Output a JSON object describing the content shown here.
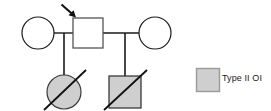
{
  "diagram": {
    "type": "pedigree-chart",
    "title": "",
    "generations": [
      {
        "id": "I",
        "members": [
          {
            "id": "I-1",
            "symbol": "circle",
            "sex": "female",
            "affected": false,
            "deceased": false,
            "proband": false,
            "fill": "#ffffff",
            "stroke": "#1a1a1a",
            "cx": 38,
            "cy": 33,
            "r": 16
          },
          {
            "id": "I-2",
            "symbol": "square",
            "sex": "male",
            "affected": false,
            "deceased": false,
            "proband": true,
            "fill": "#ffffff",
            "stroke": "#444444",
            "x": 73,
            "y": 18,
            "size": 30
          },
          {
            "id": "I-3",
            "symbol": "circle",
            "sex": "female",
            "affected": false,
            "deceased": false,
            "proband": false,
            "fill": "#ffffff",
            "stroke": "#1a1a1a",
            "cx": 155,
            "cy": 33,
            "r": 16
          }
        ]
      },
      {
        "id": "II",
        "members": [
          {
            "id": "II-1",
            "symbol": "circle",
            "sex": "female",
            "affected": true,
            "deceased": true,
            "proband": false,
            "fill": "#cfcfcf",
            "stroke": "#3a3a3a",
            "cx": 64,
            "cy": 92,
            "r": 17
          },
          {
            "id": "II-2",
            "symbol": "square",
            "sex": "male",
            "affected": true,
            "deceased": true,
            "proband": false,
            "fill": "#cfcfcf",
            "stroke": "#3a3a3a",
            "x": 109,
            "y": 76,
            "size": 32
          }
        ]
      }
    ],
    "mating_lines": [
      {
        "id": "union-1",
        "x1": 54,
        "y1": 33,
        "x2": 73,
        "y2": 33
      },
      {
        "id": "union-2",
        "x1": 103,
        "y1": 33,
        "x2": 139,
        "y2": 33
      }
    ],
    "descent_lines": [
      {
        "id": "descent-1",
        "x1": 64,
        "y1": 33,
        "x2": 64,
        "y2": 76
      },
      {
        "id": "descent-2",
        "x1": 125,
        "y1": 33,
        "x2": 125,
        "y2": 76
      }
    ],
    "deceased_slashes": [
      {
        "id": "slash-1",
        "x1": 44,
        "y1": 110,
        "x2": 86,
        "y2": 70
      },
      {
        "id": "slash-2",
        "x1": 104,
        "y1": 110,
        "x2": 147,
        "y2": 70
      }
    ],
    "proband_arrow": {
      "id": "proband-arrow",
      "points_to": "I-2",
      "x1": 61,
      "y1": 4,
      "x2": 76,
      "y2": 17,
      "color": "#111111"
    },
    "colors": {
      "affected_fill": "#cfcfcf",
      "unaffected_fill": "#ffffff",
      "stroke": "#1a1a1a",
      "line": "#1a1a1a",
      "text": "#1a1a1a"
    }
  },
  "legend": {
    "items": [
      {
        "id": "legend-type-ii-oi",
        "label": "Type II OI",
        "swatch_shape": "square",
        "swatch_fill": "#cfcfcf",
        "swatch_stroke": "#9a9a9a",
        "x": 196,
        "y": 68,
        "size": 24
      }
    ]
  }
}
